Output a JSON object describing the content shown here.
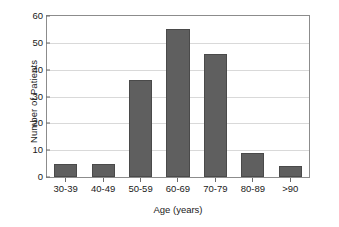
{
  "chart_data": {
    "type": "bar",
    "title": "",
    "xlabel": "Age (years)",
    "ylabel": "Number of Patients",
    "categories": [
      "30-39",
      "40-49",
      "50-59",
      "60-69",
      "70-79",
      "80-89",
      ">90"
    ],
    "values": [
      5,
      5,
      36,
      55,
      46,
      9,
      4
    ],
    "ylim": [
      0,
      60
    ],
    "yticks": [
      0,
      10,
      20,
      30,
      40,
      50,
      60
    ],
    "ytick_labels": [
      "0",
      "10",
      "20",
      "30",
      "40",
      "50",
      "60"
    ],
    "grid": "horizontal",
    "legend": "none",
    "bar_color": "#5f5f5f",
    "gridline_color": "#d9d9d9",
    "axis_color": "#8c8c8c",
    "background": "#ffffff"
  }
}
